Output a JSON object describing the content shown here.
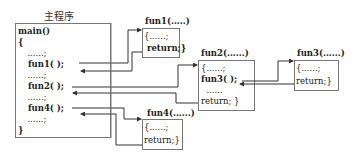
{
  "main": {
    "title": "主程序",
    "lines": [
      "main()",
      "{",
      "  ......;",
      "  fun1( );",
      "  ......;",
      "  fun2( );",
      "  ......;",
      "  fun4( );",
      "  ......;",
      "}"
    ]
  },
  "fun1": {
    "header": "fun1(.....)",
    "lines": [
      "{......;",
      " return;}"
    ]
  },
  "fun2": {
    "header": "fun2(......)",
    "lines": [
      "{......;",
      "fun3( );",
      "  ......",
      "return; }"
    ]
  },
  "fun3": {
    "header": "fun3(......)",
    "lines": [
      "{......;",
      "return;}"
    ]
  },
  "fun4": {
    "header": "fun4(......)",
    "lines": [
      "{......;",
      "return;}"
    ]
  },
  "colors": {
    "line": "#333333",
    "box_border": "#777777"
  }
}
